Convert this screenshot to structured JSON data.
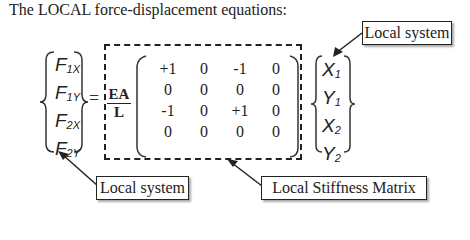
{
  "title": "The LOCAL force-displacement equations:",
  "force_vector": {
    "entries": [
      {
        "base": "F",
        "sub": "1X"
      },
      {
        "base": "F",
        "sub": "1Y"
      },
      {
        "base": "F",
        "sub": "2X"
      },
      {
        "base": "F",
        "sub": "2Y"
      }
    ]
  },
  "equals": "=",
  "factor": {
    "numerator": "EA",
    "denominator": "L"
  },
  "stiffness_matrix": [
    [
      "+1",
      "0",
      "-1",
      "0"
    ],
    [
      "0",
      "0",
      "0",
      "0"
    ],
    [
      "-1",
      "0",
      "+1",
      "0"
    ],
    [
      "0",
      "0",
      "0",
      "0"
    ]
  ],
  "displacement_vector": {
    "entries": [
      {
        "base": "X",
        "sub": "1"
      },
      {
        "base": "Y",
        "sub": "1"
      },
      {
        "base": "X",
        "sub": "2"
      },
      {
        "base": "Y",
        "sub": "2"
      }
    ]
  },
  "callouts": {
    "top_right": "Local system",
    "bottom_left": "Local system",
    "bottom_right": "Local Stiffness Matrix"
  }
}
